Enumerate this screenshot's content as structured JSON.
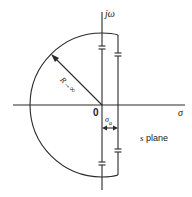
{
  "diagram": {
    "type": "s-plane contour (Nyquist / Bromwich path)",
    "labels": {
      "imag_axis": "jω",
      "real_axis": "σ",
      "origin": "0",
      "radius": "R→∞",
      "offset": "σa",
      "offset_main": "σ",
      "offset_sub": "a",
      "plane": "s plane",
      "plane_s": "s",
      "plane_word": "plane"
    },
    "colors": {
      "line": "#2a2a2a",
      "background": "#ffffff"
    }
  }
}
